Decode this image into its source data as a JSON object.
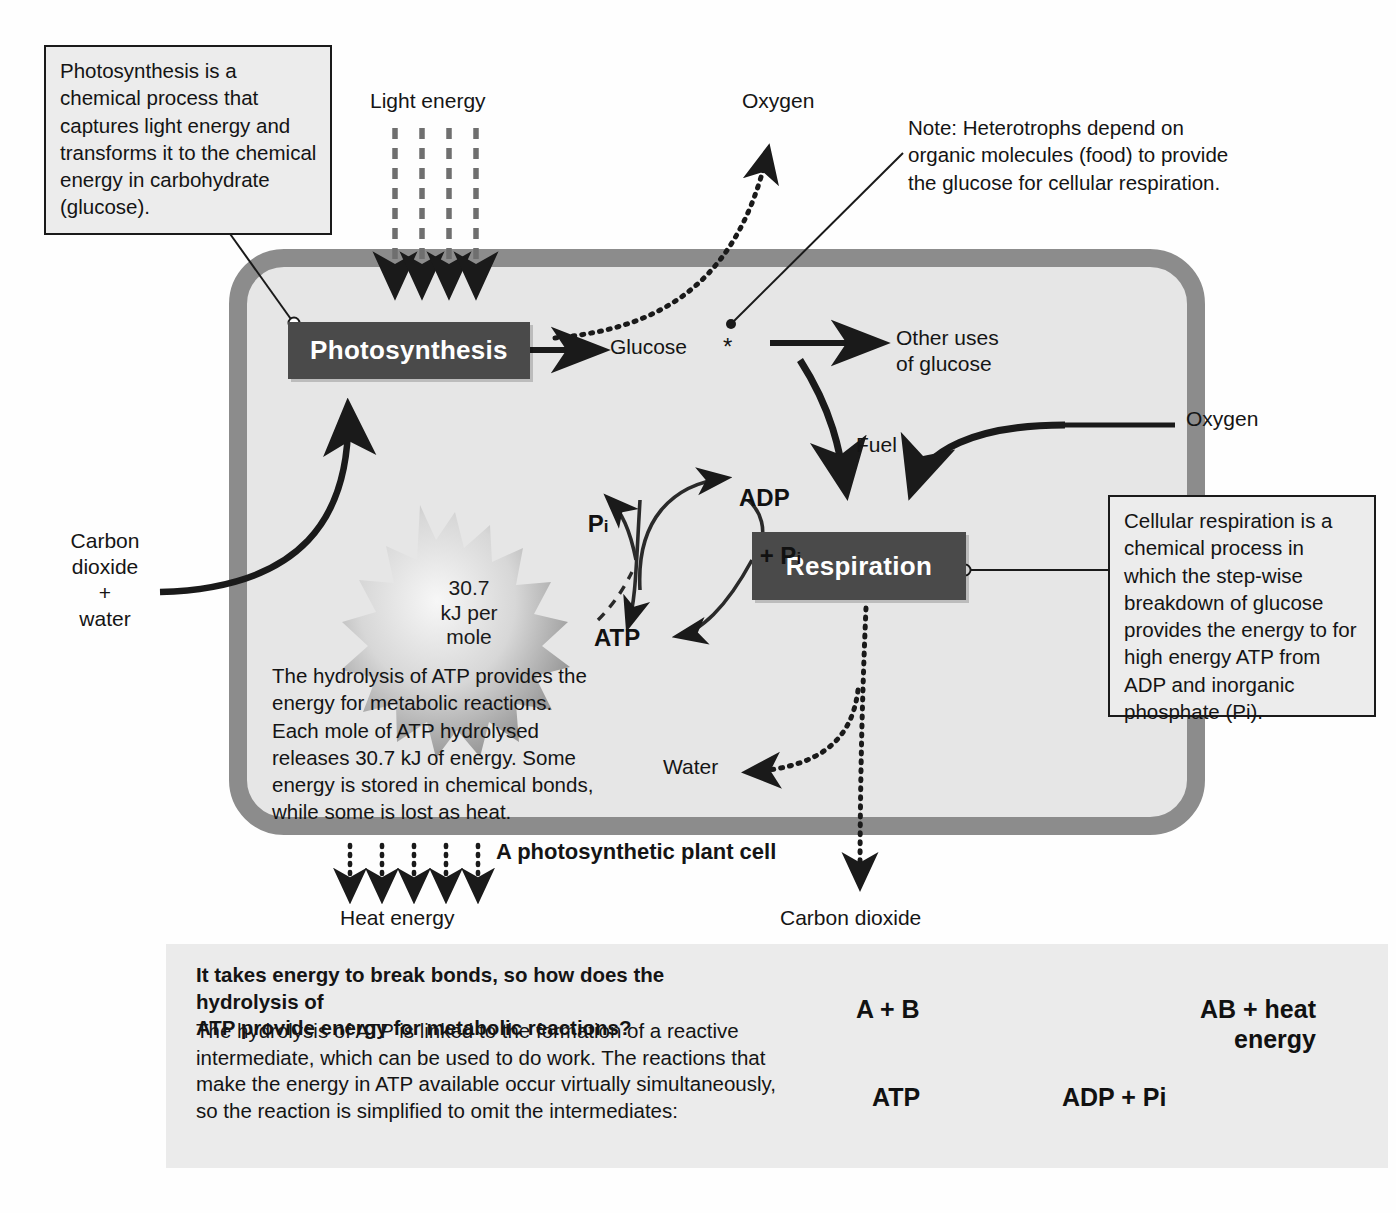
{
  "meta": {
    "accent_dark": "#4a4a4a",
    "cell_wall_color": "#8c8c8c",
    "cytoplasm_color": "#e6e6e6",
    "panel_color": "#ebebeb",
    "callout_fill": "#ececec"
  },
  "callouts": {
    "photosynthesis_note": "Photosynthesis is a\nchemical process that\ncaptures light energy and\ntransforms it to the\nchemical energy in\ncarbohydrate (glucose).",
    "heterotroph_note": "Note: Heterotrophs depend on\norganic molecules (food) to provide\nthe glucose for cellular respiration.",
    "respiration_note": "Cellular respiration is a\nchemical process in\nwhich the step-wise\nbreakdown of glucose\nprovides the energy to\nfor high energy ATP\nfrom ADP and inorganic\nphosphate (Pi)."
  },
  "diagram": {
    "process_photosynthesis": "Photosynthesis",
    "process_respiration": "Respiration",
    "cell_caption": "A photosynthetic plant cell",
    "labels": {
      "light_energy": "Light energy",
      "oxygen_out": "Oxygen",
      "oxygen_in": "Oxygen",
      "glucose": "Glucose",
      "glucose_asterisk": "*",
      "other_uses": "Other uses\nof glucose",
      "fuel": "Fuel",
      "carbon_dioxide_water": "Carbon\ndioxide\n+\nwater",
      "water_out": "Water",
      "heat_energy": "Heat energy",
      "carbon_dioxide_out": "Carbon dioxide"
    },
    "atp_cycle": {
      "adp_line1": "ADP",
      "adp_line2": "+ P",
      "adp_line2_sub": "i",
      "atp": "ATP",
      "pi": "P",
      "pi_sub": "i"
    },
    "energy_burst": "30.7\nkJ per\nmole",
    "hydrolysis_text": "The hydrolysis of ATP provides the\nenergy for metabolic reactions.\nEach mole of ATP hydrolysed\nreleases 30.7 kJ of energy. Some\nenergy is stored in chemical bonds,\nwhile some is lost as heat."
  },
  "bottom_panel": {
    "heading": "It takes energy to break bonds, so how does the hydrolysis of\nATP provide energy for metabolic reactions?",
    "body": "The hydrolysis of ATP is linked to the formation of a reactive\nintermediate, which can be used to do work. The reactions that\nmake the energy in ATP available occur virtually simultaneously,\nso the reaction is simplified to omit the intermediates:",
    "equation": {
      "reactants": "A + B",
      "products_line1": "AB + heat",
      "products_line2": "energy",
      "cofactor_in": "ATP",
      "cofactor_out": "ADP + Pi"
    }
  }
}
